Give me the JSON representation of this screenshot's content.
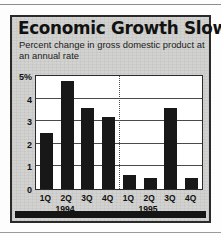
{
  "figure": {
    "title": "Economic Growth Slows",
    "subtitle": "Percent change in gross domestic product at an annual rate",
    "colors": {
      "bar": "#181818",
      "frame": "#2a2a2a",
      "background": "#d2d2d0",
      "plot_background": "#ffffff",
      "grid": "#4a4a4a"
    }
  },
  "chart_data": {
    "type": "bar",
    "title": "Economic Growth Slows",
    "subtitle": "Percent change in gross domestic product at an annual rate",
    "xlabel": "",
    "ylabel": "",
    "ylim": [
      0,
      5
    ],
    "yticks": [
      0,
      1,
      2,
      3,
      4,
      5
    ],
    "ytick_labels": [
      "0",
      "1",
      "2",
      "3",
      "4",
      "5%"
    ],
    "grid": true,
    "legend": false,
    "categories": [
      "1Q",
      "2Q",
      "3Q",
      "4Q",
      "1Q",
      "2Q",
      "3Q",
      "4Q"
    ],
    "values": [
      2.5,
      4.8,
      3.6,
      3.2,
      0.6,
      0.5,
      3.6,
      0.5
    ],
    "groups": [
      {
        "label": "1994",
        "categories": [
          "1Q",
          "2Q",
          "3Q",
          "4Q"
        ],
        "values": [
          2.5,
          4.8,
          3.6,
          3.2
        ]
      },
      {
        "label": "1995",
        "categories": [
          "1Q",
          "2Q",
          "3Q",
          "4Q"
        ],
        "values": [
          0.6,
          0.5,
          3.6,
          0.5
        ]
      }
    ],
    "annotations": [
      "dotted vertical divider between 1994 and 1995"
    ]
  }
}
